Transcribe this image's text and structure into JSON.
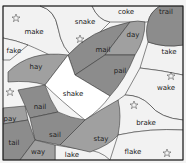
{
  "colors": {
    "background": "#f4f4f4",
    "light_region": "#f2f2f2",
    "white_region": "#ffffff",
    "medium_gray": "#a0a0a0",
    "dark_gray": "#8c8c8c",
    "stroke": "#3a3a3a",
    "frame": "#1a1a1a"
  },
  "words": {
    "make": "make",
    "snake": "snake",
    "coke": "coke",
    "trail": "trail",
    "fake": "fake",
    "day": "day",
    "take": "take",
    "hay": "hay",
    "mail": "mail",
    "pail": "pail",
    "shake": "shake",
    "wake": "wake",
    "nail": "nail",
    "pay": "pay",
    "sail": "sail",
    "brake": "brake",
    "tail": "tail",
    "stay": "stay",
    "way": "way",
    "lake": "lake",
    "flake": "flake"
  }
}
